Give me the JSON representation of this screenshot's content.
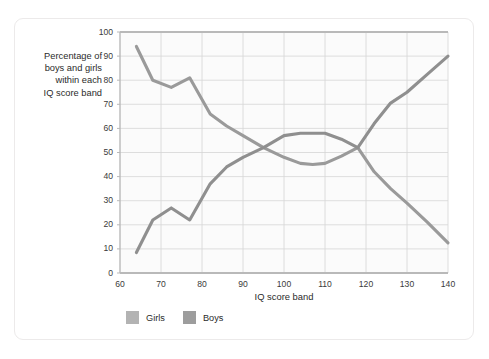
{
  "chart_data": {
    "type": "line",
    "title": "",
    "xlabel": "IQ score band",
    "ylabel": "Percentage of boys and girls within each IQ score band",
    "ylabel_lines": [
      "Percentage of",
      "boys and girls",
      "within each",
      "IQ score band"
    ],
    "xlim": [
      60,
      140
    ],
    "ylim": [
      0,
      100
    ],
    "xticks": [
      60,
      70,
      80,
      90,
      100,
      110,
      120,
      130,
      140
    ],
    "yticks": [
      0,
      10,
      20,
      30,
      40,
      50,
      60,
      70,
      80,
      90,
      100
    ],
    "grid": true,
    "legend_position": "bottom-left",
    "series": [
      {
        "name": "Girls",
        "color": "#9a9a9a",
        "x": [
          64,
          68,
          72.5,
          77,
          82,
          86,
          90,
          95,
          100,
          104,
          107,
          110,
          114,
          118,
          122,
          126,
          130,
          135,
          140
        ],
        "values": [
          94,
          80,
          77,
          81,
          66,
          61,
          57,
          52,
          48,
          45.5,
          45,
          45.5,
          48.5,
          52,
          42,
          35,
          29,
          21,
          12.5
        ]
      },
      {
        "name": "Boys",
        "color": "#8f8f8f",
        "x": [
          64,
          68,
          72.5,
          77,
          82,
          86,
          90,
          95,
          100,
          104,
          107,
          110,
          114,
          118,
          122,
          126,
          130,
          135,
          140
        ],
        "values": [
          8.5,
          22,
          27,
          22,
          37,
          44,
          48,
          52,
          57,
          58,
          58,
          58,
          55.5,
          52,
          62,
          70.5,
          75,
          82.5,
          90
        ]
      }
    ]
  },
  "legend": {
    "items": [
      {
        "label": "Girls",
        "color": "#b3b3b3"
      },
      {
        "label": "Boys",
        "color": "#9d9d9d"
      }
    ]
  },
  "colors": {
    "card_border": "#eceaea",
    "grid": "#d6d6d6",
    "axis": "#b9b9b9",
    "text": "#2b2b2b",
    "plot_background": "#fbfbfb"
  }
}
